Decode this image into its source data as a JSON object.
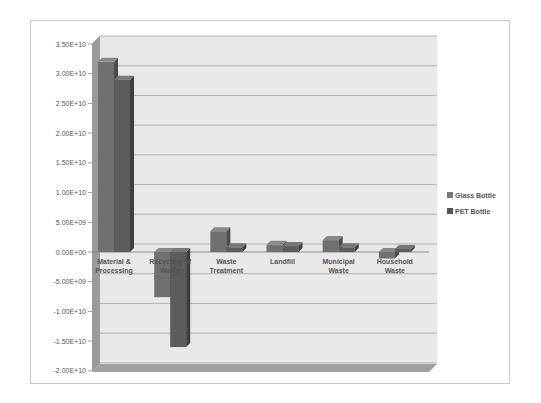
{
  "chart_data": {
    "type": "bar",
    "style": "3d-clustered-column",
    "title": "",
    "xlabel": "",
    "ylabel": "",
    "ylim": [
      -20000000000.0,
      35000000000.0
    ],
    "y_ticks": [
      "3.50E+10",
      "3.00E+10",
      "2.50E+10",
      "2.00E+10",
      "1.50E+10",
      "1.00E+10",
      "5.00E+09",
      "0.00E+00",
      "-5.00E+09",
      "-1.00E+10",
      "-1.50E+10",
      "-2.00E+10"
    ],
    "grid": true,
    "legend_position": "right",
    "categories": [
      "Material & Processing",
      "Recycling of Waste",
      "Waste Treatment",
      "Landfill",
      "Municipal Waste",
      "Household Waste"
    ],
    "category_lines": [
      [
        "Material &",
        "Processing"
      ],
      [
        "Recycling of",
        "Waste"
      ],
      [
        "Waste",
        "Treatment"
      ],
      [
        "Landfill",
        ""
      ],
      [
        "Municipal",
        "Waste"
      ],
      [
        "Household",
        "Waste"
      ]
    ],
    "series": [
      {
        "name": "Glass Bottle",
        "color": "#6e6e6e",
        "values": [
          32000000000.0,
          -7600000000.0,
          3500000000.0,
          1200000000.0,
          2000000000.0,
          -1100000000.0
        ]
      },
      {
        "name": "PET Bottle",
        "color": "#5a5a5a",
        "values": [
          29000000000.0,
          -16000000000.0,
          800000000.0,
          1000000000.0,
          800000000.0,
          500000000.0
        ]
      }
    ]
  }
}
